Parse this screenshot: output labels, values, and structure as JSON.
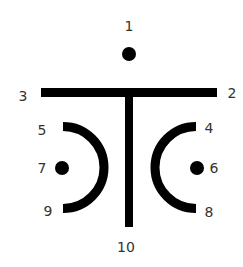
{
  "diagram": {
    "stroke_color": "#000000",
    "label_color": "#333333",
    "background": "#ffffff",
    "labels": {
      "l1": "1",
      "l2": "2",
      "l3": "3",
      "l4": "4",
      "l5": "5",
      "l6": "6",
      "l7": "7",
      "l8": "8",
      "l9": "9",
      "l10": "10"
    },
    "elements": [
      {
        "id": 1,
        "shape": "dot",
        "position": "top-center"
      },
      {
        "id": 2,
        "shape": "bar-end",
        "position": "right end of horizontal bar"
      },
      {
        "id": 3,
        "shape": "bar-end",
        "position": "left end of horizontal bar"
      },
      {
        "id": 4,
        "shape": "arc-end",
        "position": "top of right arc"
      },
      {
        "id": 5,
        "shape": "arc-end",
        "position": "top of left arc"
      },
      {
        "id": 6,
        "shape": "dot",
        "position": "inside right arc"
      },
      {
        "id": 7,
        "shape": "dot",
        "position": "inside left arc"
      },
      {
        "id": 8,
        "shape": "arc-end",
        "position": "bottom of right arc"
      },
      {
        "id": 9,
        "shape": "arc-end",
        "position": "bottom of left arc"
      },
      {
        "id": 10,
        "shape": "stem-end",
        "position": "bottom of vertical stem"
      }
    ]
  }
}
